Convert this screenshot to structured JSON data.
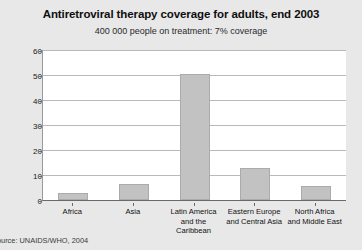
{
  "chart_data": {
    "type": "bar",
    "title": "Antiretroviral therapy coverage for adults, end 2003",
    "subtitle": "400 000 people on treatment: 7% coverage",
    "categories": [
      "Africa",
      "Latin America\nand the Caribbean",
      "Asia",
      "Eastern Europe\nand Central Asia",
      "North Africa\nand Middle East"
    ],
    "category_lines": [
      [
        "Africa"
      ],
      [
        "Asia"
      ],
      [
        "Latin America",
        "and the Caribbean"
      ],
      [
        "Eastern Europe",
        "and Central Asia"
      ],
      [
        "North Africa",
        "and Middle East"
      ]
    ],
    "categories_ordered": [
      "Africa",
      "Asia",
      "Latin America and the Caribbean",
      "Eastern Europe and Central Asia",
      "North Africa and Middle East"
    ],
    "values": [
      3,
      6.5,
      50.5,
      13,
      5.5
    ],
    "xlabel": "",
    "ylabel": "%",
    "ylim": [
      0,
      60
    ],
    "ytick_values": [
      0,
      10,
      20,
      30,
      40,
      50,
      60
    ],
    "ytick_labels": [
      "0",
      "10",
      "20",
      "30",
      "40",
      "50",
      "60"
    ],
    "grid": true,
    "legend": false,
    "bar_color": "#c2c2c2",
    "bar_border_color": "#ababab",
    "plot_background": "#ffffff",
    "figure_background": "#e8e8e8",
    "source": "Source: UNAIDS/WHO, 2004"
  }
}
